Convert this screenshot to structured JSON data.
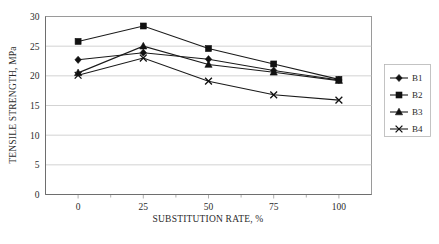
{
  "chart_data": {
    "type": "line",
    "title": "",
    "xlabel": "SUBSTITUTION RATE, %",
    "ylabel": "TENSILE STRENGTH, MPa",
    "x": [
      0,
      25,
      50,
      75,
      100
    ],
    "xticklabels": [
      "0",
      "25",
      "50",
      "75",
      "100"
    ],
    "yticklabels": [
      "0",
      "5",
      "10",
      "15",
      "20",
      "25",
      "30"
    ],
    "yticks": [
      0,
      5,
      10,
      15,
      20,
      25,
      30
    ],
    "xlim": [
      -12.5,
      112.5
    ],
    "ylim": [
      0,
      30
    ],
    "grid": "horizontal",
    "legend_position": "right",
    "series": [
      {
        "name": "B1",
        "marker": "diamond",
        "values": [
          22.7,
          23.9,
          22.8,
          20.9,
          19.3
        ]
      },
      {
        "name": "B2",
        "marker": "square",
        "values": [
          25.8,
          28.4,
          24.6,
          22.0,
          19.4
        ]
      },
      {
        "name": "B3",
        "marker": "triangle",
        "values": [
          20.5,
          25.0,
          21.9,
          20.6,
          19.2
        ]
      },
      {
        "name": "B4",
        "marker": "cross",
        "values": [
          20.1,
          23.0,
          19.1,
          16.8,
          15.9
        ]
      }
    ]
  },
  "legend": {
    "entries": [
      {
        "label": "B1"
      },
      {
        "label": "B2"
      },
      {
        "label": "B3"
      },
      {
        "label": "B4"
      }
    ]
  },
  "caption": {
    "text": ""
  }
}
